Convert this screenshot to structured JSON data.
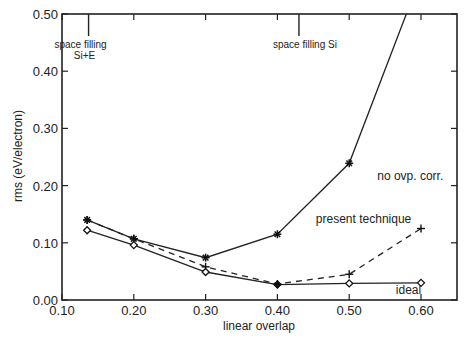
{
  "chart_data": {
    "type": "line",
    "title": "",
    "xlabel": "linear overlap",
    "ylabel": "rms (eV/electron)",
    "xlim": [
      0.1,
      0.65
    ],
    "ylim": [
      0.0,
      0.5
    ],
    "xticks": [
      0.1,
      0.2,
      0.3,
      0.4,
      0.5,
      0.6
    ],
    "xtick_labels": [
      "0.10",
      "0.20",
      "0.30",
      "0.40",
      "0.50",
      "0.60"
    ],
    "yticks": [
      0.0,
      0.1,
      0.2,
      0.3,
      0.4,
      0.5
    ],
    "ytick_labels": [
      "0.00",
      "0.10",
      "0.20",
      "0.30",
      "0.40",
      "0.50"
    ],
    "grid": false,
    "legend": "none (inline labels)",
    "series": [
      {
        "name": "no ovp. corr.",
        "line_style": "solid",
        "marker": "asterisk",
        "x": [
          0.135,
          0.2,
          0.3,
          0.4,
          0.5,
          0.6
        ],
        "y": [
          0.14,
          0.107,
          0.074,
          0.115,
          0.239,
          0.567
        ],
        "label_at": [
          0.585,
          0.21
        ]
      },
      {
        "name": "present technique",
        "line_style": "dashed",
        "marker": "plus",
        "x": [
          0.135,
          0.2,
          0.3,
          0.4,
          0.5,
          0.6
        ],
        "y": [
          0.14,
          0.107,
          0.058,
          0.028,
          0.045,
          0.125
        ],
        "label_at": [
          0.52,
          0.135
        ]
      },
      {
        "name": "ideal",
        "line_style": "solid",
        "marker": "diamond",
        "x": [
          0.135,
          0.2,
          0.3,
          0.4,
          0.5,
          0.6
        ],
        "y": [
          0.122,
          0.096,
          0.049,
          0.027,
          0.029,
          0.03
        ],
        "label_at": [
          0.565,
          0.01
        ]
      }
    ],
    "annotations": [
      {
        "lines": [
          "space filling",
          "Si+E"
        ],
        "x": 0.137,
        "align": "center"
      },
      {
        "lines": [
          "space filling Si"
        ],
        "x": 0.43,
        "align": "center"
      }
    ]
  }
}
